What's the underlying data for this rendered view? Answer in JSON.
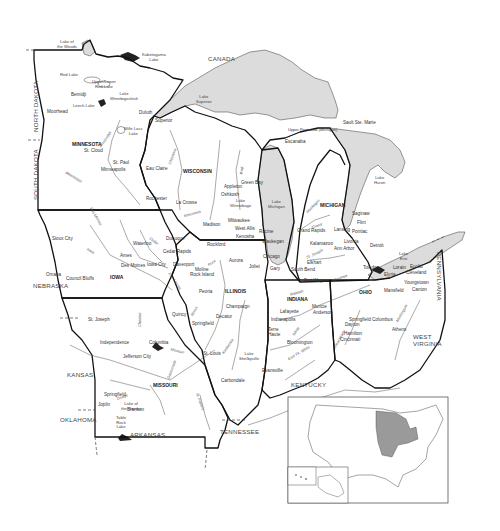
{
  "map": {
    "title": "Midwest United States (Great Lakes region) reference map",
    "colors": {
      "land": "#ffffff",
      "water": "#dcdcdc",
      "state_border": "#111111",
      "river": "#555555",
      "highlight_states_inset": "#9a9a9a"
    },
    "states": {
      "minnesota": "MINNESOTA",
      "wisconsin": "WISCONSIN",
      "michigan": "MICHIGAN",
      "iowa": "IOWA",
      "illinois": "ILLINOIS",
      "indiana": "INDIANA",
      "ohio": "OHIO",
      "missouri": "MISSOURI"
    },
    "neighbors": {
      "canada": "CANADA",
      "north_dakota": "NORTH DAKOTA",
      "south_dakota": "SOUTH DAKOTA",
      "nebraska": "NEBRASKA",
      "kansas": "KANSAS",
      "oklahoma": "OKLAHOMA",
      "arkansas": "ARKANSAS",
      "tennessee": "TENNESSEE",
      "kentucky": "KENTUCKY",
      "west_virginia": "WEST\nVIRGINIA",
      "pennsylvania": "PENNSYLVANIA"
    },
    "lakes": {
      "lake_of_the_woods": "Lake of\nthe Woods",
      "kabetogama": "Kabetogama\nLake",
      "red_lake": "Red Lake",
      "upper_lower_red": "Upper/Lower\nRed Lake",
      "winnibigoshish": "Lake\nWinnibigoshish",
      "leech": "Leech Lake",
      "mille_lacs": "Mille Lacs\nLake",
      "superior": "Lake\nSuperior",
      "michigan": "Lake\nMichigan",
      "huron": "Lake\nHuron",
      "erie": "Lake\nErie",
      "winnebago": "Lake\nWinnebago",
      "shelbyville": "Lake\nShelbyville",
      "ozarks": "Lake of\nthe Ozarks",
      "table_rock": "Table\nRock\nLake"
    },
    "regions": {
      "upper_peninsula": "Upper Peninsula (Michigan)"
    },
    "cities": {
      "moorhead": "Moorhead",
      "bemidji": "Bemidji",
      "duluth": "Duluth",
      "superior": "Superior",
      "st_cloud": "St. Cloud",
      "st_paul": "St. Paul",
      "minneapolis": "Minneapolis",
      "rochester": "Rochester",
      "eau_claire": "Eau Claire",
      "la_crosse": "La Crosse",
      "green_bay": "Green Bay",
      "appleton": "Appleton",
      "oshkosh": "Oshkosh",
      "madison": "Madison",
      "milwaukee": "Milwaukee",
      "west_allis": "West Allis",
      "kenosha": "Kenosha",
      "racine": "Racine",
      "escanaba": "Escanaba",
      "sault_ste_marie": "Sault Ste. Marie",
      "saginaw": "Saginaw",
      "flint": "Flint",
      "pontiac": "Pontiac",
      "lansing": "Lansing",
      "grand_rapids": "Grand Rapids",
      "livonia": "Livonia",
      "ann_arbor": "Ann Arbor",
      "kalamazoo": "Kalamazoo",
      "detroit": "Detroit",
      "toledo": "Toledo",
      "sioux_city": "Sioux City",
      "omaha": "Omaha",
      "council_bluffs": "Council Bluffs",
      "ames": "Ames",
      "des_moines": "Des Moines",
      "iowa_city": "Iowa City",
      "waterloo": "Waterloo",
      "cedar_rapids": "Cedar Rapids",
      "dubuque": "Dubuque",
      "davenport": "Davenport",
      "moline": "Moline",
      "rock_island": "Rock Island",
      "rockford": "Rockford",
      "aurora": "Aurora",
      "joliet": "Joliet",
      "waukegan": "Waukegan",
      "chicago": "Chicago",
      "gary": "Gary",
      "elkhart": "Elkhart",
      "south_bend": "South Bend",
      "fort_wayne": "Fort Wayne",
      "peoria": "Peoria",
      "champaign": "Champaign",
      "decatur": "Decatur",
      "springfield_il": "Springfield",
      "quincy": "Quincy",
      "st_louis": "St. Louis",
      "carbondale": "Carbondale",
      "lafayette": "Lafayette",
      "muncie": "Muncie",
      "anderson": "Anderson",
      "indianapolis": "Indianapolis",
      "terre_haute": "Terre\nHaute",
      "bloomington": "Bloomington",
      "evansville": "Evansville",
      "elyria": "Elyria",
      "lorain": "Lorain",
      "euclid": "Euclid",
      "cleveland": "Cleveland",
      "youngstown": "Youngstown",
      "canton": "Canton",
      "mansfield": "Mansfield",
      "springfield_oh": "Springfield",
      "dayton": "Dayton",
      "columbus": "Columbus",
      "hamilton": "Hamilton",
      "cincinnati": "Cincinnati",
      "athens": "Athens",
      "st_joseph": "St. Joseph",
      "independence": "Independence",
      "columbia": "Columbia",
      "jefferson_city": "Jefferson City",
      "springfield_mo": "Springfield",
      "joplin": "Joplin",
      "branson": "Branson"
    },
    "rivers": {
      "mississippi": "Mississippi",
      "missouri": "Missouri",
      "chippewa": "Chippewa",
      "wisconsin": "Wisconsin",
      "illinois": "Illinois",
      "wabash": "Wabash",
      "maumee": "Maumee",
      "ohio": "Ohio",
      "muskingum": "Muskingum",
      "east_fork_white": "East Fk. White",
      "white": "White",
      "des_moines": "Des Moines",
      "iowa": "Iowa",
      "cedar": "Cedar",
      "chariton": "Chariton",
      "osage": "Osage",
      "gasconade": "Gasconade",
      "st_francis": "St. Francis",
      "kaskaskia": "Kaskaskia",
      "grand": "Grand",
      "st_joseph": "St. Joseph",
      "muskegon": "Muskegon",
      "wolf": "Wolf",
      "rock": "Rock",
      "great_miami": "Great Miami"
    },
    "inset": {
      "label": "United States locator map",
      "highlighted": [
        "Minnesota",
        "Wisconsin",
        "Michigan",
        "Iowa",
        "Illinois",
        "Indiana",
        "Ohio",
        "Missouri"
      ]
    }
  }
}
